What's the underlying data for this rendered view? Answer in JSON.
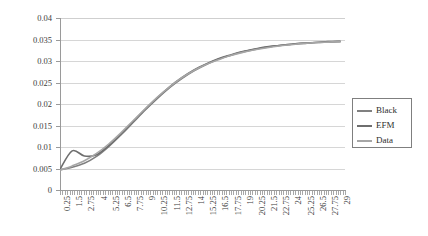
{
  "chart_data": {
    "type": "line",
    "title": "",
    "xlabel": "",
    "ylabel": "",
    "ylim": [
      0,
      0.04
    ],
    "ytick_labels": [
      "0.04",
      "0.035",
      "0.03",
      "0.025",
      "0.02",
      "0.015",
      "0.01",
      "0.005",
      "0"
    ],
    "ytick_values": [
      0.04,
      0.035,
      0.03,
      0.025,
      0.02,
      0.015,
      0.01,
      0.005,
      0
    ],
    "grid": "horizontal",
    "legend_position": "right",
    "xlim": [
      0.25,
      29.5
    ],
    "categories": [
      "0.25",
      "1.5",
      "2.75",
      "4",
      "5.25",
      "6.5",
      "7.75",
      "9",
      "10.25",
      "11.5",
      "12.75",
      "14",
      "15.25",
      "16.5",
      "17.75",
      "19",
      "20.25",
      "21.5",
      "22.75",
      "24",
      "25.25",
      "26.5",
      "27.75",
      "29"
    ],
    "x": [
      0.25,
      1.5,
      2.75,
      4,
      5.25,
      6.5,
      7.75,
      9,
      10.25,
      11.5,
      12.75,
      14,
      15.25,
      16.5,
      17.75,
      19,
      20.25,
      21.5,
      22.75,
      24,
      25.25,
      26.5,
      27.75,
      29
    ],
    "series": [
      {
        "name": "Black",
        "color": "#808080",
        "values": [
          0.0047,
          0.0053,
          0.0062,
          0.0078,
          0.0101,
          0.0128,
          0.0157,
          0.0186,
          0.0213,
          0.0238,
          0.0259,
          0.0277,
          0.0292,
          0.0304,
          0.0313,
          0.0321,
          0.0327,
          0.0332,
          0.0336,
          0.0339,
          0.0341,
          0.0343,
          0.0344,
          0.0345
        ]
      },
      {
        "name": "EFM",
        "color": "#6e6e6e",
        "values": [
          0.0048,
          0.0091,
          0.0079,
          0.0082,
          0.0103,
          0.013,
          0.0159,
          0.0188,
          0.0215,
          0.024,
          0.0261,
          0.0279,
          0.0293,
          0.0305,
          0.0314,
          0.0322,
          0.0328,
          0.0333,
          0.0336,
          0.0339,
          0.0342,
          0.0343,
          0.0345,
          0.0346
        ]
      },
      {
        "name": "Data",
        "color": "#a6a6a6",
        "values": [
          0.0046,
          0.0056,
          0.0068,
          0.0085,
          0.0107,
          0.0133,
          0.0161,
          0.0189,
          0.0216,
          0.024,
          0.0261,
          0.0278,
          0.0292,
          0.0303,
          0.0313,
          0.032,
          0.0326,
          0.0331,
          0.0335,
          0.0338,
          0.0341,
          0.0343,
          0.0344,
          0.0345
        ]
      }
    ]
  },
  "legend": {
    "items": [
      {
        "label": "Black"
      },
      {
        "label": "EFM"
      },
      {
        "label": "Data"
      }
    ]
  }
}
